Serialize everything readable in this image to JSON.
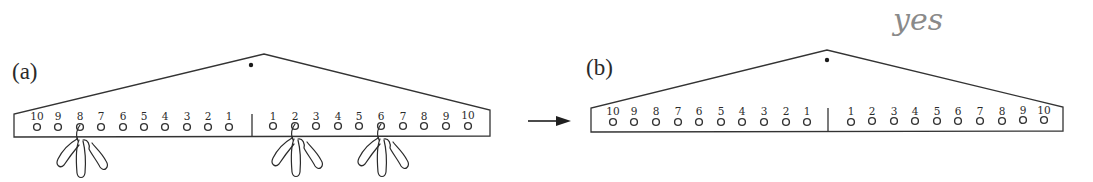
{
  "figure": {
    "annotation": "yes",
    "arrow_icon": "right-arrow-icon",
    "panels": [
      {
        "id": "a",
        "label": "(a)",
        "left_labels": [
          "10",
          "9",
          "8",
          "7",
          "6",
          "5",
          "4",
          "3",
          "2",
          "1"
        ],
        "right_labels": [
          "1",
          "2",
          "3",
          "4",
          "5",
          "6",
          "7",
          "8",
          "9",
          "10"
        ],
        "weights": [
          {
            "side": "left",
            "position": "8",
            "clips": 3
          },
          {
            "side": "right",
            "position": "2",
            "clips": 3
          },
          {
            "side": "right",
            "position": "6",
            "clips": 3
          }
        ]
      },
      {
        "id": "b",
        "label": "(b)",
        "left_labels": [
          "10",
          "9",
          "8",
          "7",
          "6",
          "5",
          "4",
          "3",
          "2",
          "1"
        ],
        "right_labels": [
          "1",
          "2",
          "3",
          "4",
          "5",
          "6",
          "7",
          "8",
          "9",
          "10"
        ],
        "weights": []
      }
    ]
  }
}
